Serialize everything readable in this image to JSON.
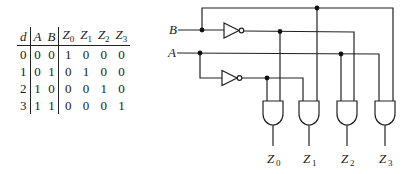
{
  "truth_table": {
    "headers": [
      {
        "name": "d",
        "sub": ""
      },
      {
        "name": "A",
        "sub": ""
      },
      {
        "name": "B",
        "sub": ""
      },
      {
        "name": "Z",
        "sub": "0"
      },
      {
        "name": "Z",
        "sub": "1"
      },
      {
        "name": "Z",
        "sub": "2"
      },
      {
        "name": "Z",
        "sub": "3"
      }
    ],
    "rows": [
      [
        "0",
        "0",
        "0",
        "1",
        "0",
        "0",
        "0"
      ],
      [
        "1",
        "0",
        "1",
        "0",
        "1",
        "0",
        "0"
      ],
      [
        "2",
        "1",
        "0",
        "0",
        "0",
        "1",
        "0"
      ],
      [
        "3",
        "1",
        "1",
        "0",
        "0",
        "0",
        "1"
      ]
    ]
  },
  "circuit": {
    "inputs": [
      {
        "label": "B"
      },
      {
        "label": "A"
      }
    ],
    "outputs": [
      {
        "name": "Z",
        "sub": "0"
      },
      {
        "name": "Z",
        "sub": "1"
      },
      {
        "name": "Z",
        "sub": "2"
      },
      {
        "name": "Z",
        "sub": "3"
      }
    ],
    "gates": [
      "NOT",
      "NOT",
      "AND",
      "AND",
      "AND",
      "AND"
    ]
  }
}
